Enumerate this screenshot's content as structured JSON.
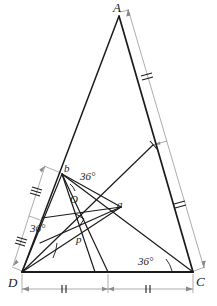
{
  "figure": {
    "stroke_color": "#1b1b1b",
    "dim_color": "#8a8a8a",
    "background": "#ffffff",
    "vertices": [
      {
        "name": "A",
        "label": "A",
        "x": 119,
        "y": 14
      },
      {
        "name": "D",
        "label": "D",
        "x": 22,
        "y": 272
      },
      {
        "name": "C",
        "label": "C",
        "x": 193,
        "y": 272
      },
      {
        "name": "b",
        "label": "b",
        "x": 62,
        "y": 174
      },
      {
        "name": "a",
        "label": "a",
        "x": 117,
        "y": 209
      },
      {
        "name": "O",
        "label": "O",
        "x": 79,
        "y": 199
      },
      {
        "name": "p",
        "label": "p",
        "x": 83,
        "y": 237
      }
    ],
    "label_positions": [
      {
        "name": "A",
        "text": "A",
        "x": 113,
        "y": 12,
        "size": 13
      },
      {
        "name": "D",
        "text": "D",
        "x": 8,
        "y": 287,
        "size": 13
      },
      {
        "name": "C",
        "text": "C",
        "x": 196,
        "y": 286,
        "size": 13
      },
      {
        "name": "b",
        "text": "b",
        "x": 64,
        "y": 172,
        "size": 11
      },
      {
        "name": "a",
        "text": "a",
        "x": 117,
        "y": 208,
        "size": 11
      },
      {
        "name": "O",
        "text": "O",
        "x": 70,
        "y": 203,
        "size": 11
      },
      {
        "name": "p",
        "text": "p",
        "x": 76,
        "y": 243,
        "size": 11
      }
    ],
    "angles": [
      {
        "name": "angle-at-b",
        "text": "36°",
        "x": 80,
        "y": 180,
        "vertex": "b"
      },
      {
        "name": "angle-at-D",
        "text": "36°",
        "x": 36,
        "y": 232,
        "vertex": "D"
      },
      {
        "name": "angle-at-C",
        "text": "36°",
        "x": 143,
        "y": 264,
        "vertex": "C"
      }
    ],
    "tick_marks": {
      "left_upper": 3,
      "left_lower": 3,
      "right_upper": 2,
      "right_lower": 2,
      "bottom_left": 2,
      "bottom_right": 2
    },
    "segment_points": {
      "ac_midpoint": {
        "x": 153,
        "y": 145
      },
      "dc_midpoint": {
        "x": 108,
        "y": 272
      },
      "ad_b_point": {
        "x": 62,
        "y": 174
      }
    }
  }
}
